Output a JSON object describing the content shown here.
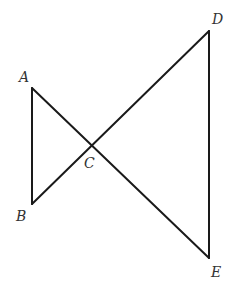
{
  "diagram": {
    "type": "geometry",
    "points": {
      "A": {
        "label": "A",
        "x": 32,
        "y": 88,
        "lx": 19,
        "ly": 82
      },
      "B": {
        "label": "B",
        "x": 32,
        "y": 204,
        "lx": 16,
        "ly": 221
      },
      "C": {
        "label": "C",
        "x": 91,
        "y": 147,
        "lx": 84,
        "ly": 168
      },
      "D": {
        "label": "D",
        "x": 209,
        "y": 31,
        "lx": 212,
        "ly": 24
      },
      "E": {
        "label": "E",
        "x": 209,
        "y": 258,
        "lx": 211,
        "ly": 277
      }
    },
    "segments": [
      {
        "from": "A",
        "to": "B"
      },
      {
        "from": "A",
        "to": "E"
      },
      {
        "from": "B",
        "to": "D"
      },
      {
        "from": "D",
        "to": "E"
      }
    ],
    "line_color": "#1a1a1a",
    "label_color": "#333333"
  }
}
